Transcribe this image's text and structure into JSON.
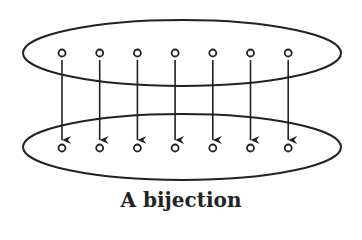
{
  "diagram": {
    "caption": "A bijection",
    "top_set": {
      "element_count": 7
    },
    "bottom_set": {
      "element_count": 7
    },
    "mappings": [
      [
        0,
        0
      ],
      [
        1,
        1
      ],
      [
        2,
        2
      ],
      [
        3,
        3
      ],
      [
        4,
        4
      ],
      [
        5,
        5
      ],
      [
        6,
        6
      ]
    ],
    "colors": {
      "stroke": "#222222",
      "background": "#ffffff"
    }
  }
}
